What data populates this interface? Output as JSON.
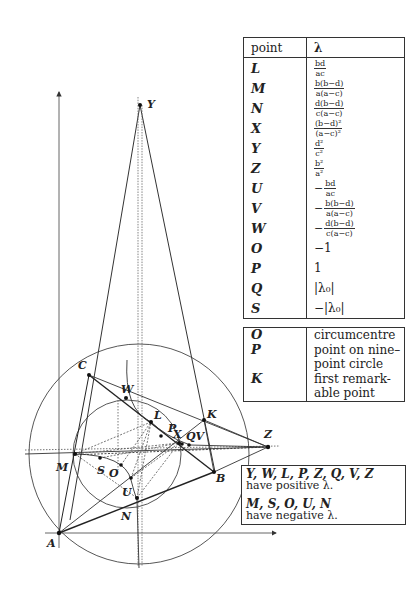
{
  "table": {
    "header": {
      "point": "point",
      "lambda": "λ"
    },
    "rows": [
      {
        "point": "L",
        "sign": "",
        "num": "bd",
        "den": "ac"
      },
      {
        "point": "M",
        "sign": "",
        "num": "b(b−d)",
        "den": "a(a−c)"
      },
      {
        "point": "N",
        "sign": "",
        "num": "d(b−d)",
        "den": "c(a−c)"
      },
      {
        "point": "X",
        "sign": "",
        "num": "(b−d)²",
        "den": "(a−c)²"
      },
      {
        "point": "Y",
        "sign": "",
        "num": "d²",
        "den": "c²"
      },
      {
        "point": "Z",
        "sign": "",
        "num": "b²",
        "den": "a²"
      },
      {
        "point": "U",
        "sign": "−",
        "num": "bd",
        "den": "ac"
      },
      {
        "point": "V",
        "sign": "−",
        "num": "b(b−d)",
        "den": "a(a−c)"
      },
      {
        "point": "W",
        "sign": "−",
        "num": "d(b−d)",
        "den": "c(a−c)"
      },
      {
        "point": "O",
        "value": "−1"
      },
      {
        "point": "P",
        "value": "1"
      },
      {
        "point": "Q",
        "value": "|λ₀|"
      },
      {
        "point": "S",
        "value": "−|λ₀|"
      }
    ]
  },
  "legend_table": {
    "rows": [
      {
        "point": "O",
        "desc": "circumcentre"
      },
      {
        "point": "P",
        "desc": "point on nine–point circle"
      },
      {
        "point": "K",
        "desc": "first remark-able point"
      }
    ]
  },
  "note": {
    "positive_points": "Y, W, L, P, Z, Q, V, Z",
    "positive_text": "have positive λ.",
    "negative_points": "M, S, O, U, N",
    "negative_text": "have negative λ."
  },
  "diagram": {
    "point_labels": {
      "Y": "Y",
      "C": "C",
      "W": "W",
      "L": "L",
      "P": "P",
      "X": "X",
      "QV": "QV",
      "K": "K",
      "Z": "Z",
      "M": "M",
      "S": "S",
      "O": "O",
      "U": "U",
      "B": "B",
      "N": "N",
      "A": "A"
    }
  }
}
